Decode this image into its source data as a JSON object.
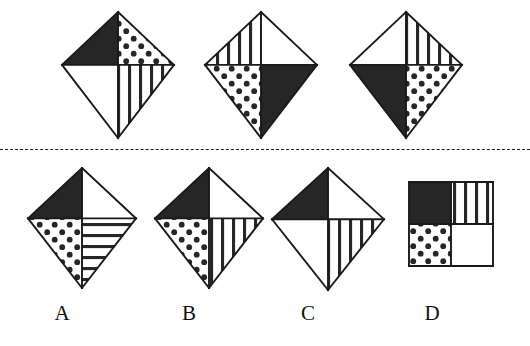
{
  "item": {
    "type": "nonverbal-pattern-reasoning",
    "background_color": "#ffffff",
    "ink_color": "#1a1a1a",
    "fill_black": "#262626",
    "fill_white": "#ffffff",
    "separator": {
      "style": "dashed",
      "y": 149
    }
  },
  "stem": {
    "name": "stem-row",
    "description": "three kite figures forming the sequence",
    "figures": [
      {
        "id": "stem-1",
        "shape": "kite",
        "x": 62,
        "y": 12,
        "w": 112,
        "h": 126,
        "quadrants": {
          "top_left": "black",
          "top_right": "dotted",
          "bottom_left": "white",
          "bottom_right": "vertical-stripes"
        }
      },
      {
        "id": "stem-2",
        "shape": "kite",
        "x": 205,
        "y": 12,
        "w": 112,
        "h": 126,
        "quadrants": {
          "top_left": "vertical-stripes",
          "top_right": "white",
          "bottom_left": "dotted",
          "bottom_right": "black"
        }
      },
      {
        "id": "stem-3",
        "shape": "kite",
        "x": 350,
        "y": 12,
        "w": 112,
        "h": 126,
        "quadrants": {
          "top_left": "white",
          "top_right": "vertical-stripes",
          "bottom_left": "black",
          "bottom_right": "dotted"
        }
      }
    ]
  },
  "options": {
    "name": "answer-options-row",
    "labels": [
      "A",
      "B",
      "C",
      "D"
    ],
    "items": [
      {
        "id": "option-a",
        "label": "A",
        "shape": "kite",
        "x": 28,
        "y": 168,
        "w": 108,
        "h": 120,
        "label_x": 62,
        "label_y": 303,
        "quadrants": {
          "top_left": "black",
          "top_right": "white",
          "bottom_left": "dotted",
          "bottom_right": "horizontal-stripes"
        }
      },
      {
        "id": "option-b",
        "label": "B",
        "shape": "kite",
        "x": 155,
        "y": 168,
        "w": 108,
        "h": 120,
        "label_x": 189,
        "label_y": 303,
        "quadrants": {
          "top_left": "black",
          "top_right": "white",
          "bottom_left": "dotted",
          "bottom_right": "vertical-stripes"
        }
      },
      {
        "id": "option-c",
        "label": "C",
        "shape": "kite",
        "x": 272,
        "y": 168,
        "w": 112,
        "h": 122,
        "label_x": 308,
        "label_y": 303,
        "quadrants": {
          "top_left": "black",
          "top_right": "white",
          "bottom_left": "white",
          "bottom_right": "vertical-stripes"
        }
      },
      {
        "id": "option-d",
        "label": "D",
        "shape": "square",
        "x": 409,
        "y": 182,
        "w": 84,
        "h": 84,
        "label_x": 432,
        "label_y": 303,
        "quadrants": {
          "top_left": "black",
          "top_right": "vertical-stripes",
          "bottom_left": "dotted",
          "bottom_right": "white"
        }
      }
    ]
  }
}
